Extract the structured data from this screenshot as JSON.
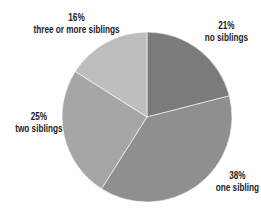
{
  "chart_data": {
    "type": "pie",
    "title": "",
    "categories": [
      "no siblings",
      "one sibling",
      "two siblings",
      "three or more siblings"
    ],
    "values": [
      21,
      38,
      25,
      16
    ],
    "labels": [
      "21%",
      "38%",
      "25%",
      "16%"
    ],
    "colors": [
      "#7b7b7b",
      "#8f8f8f",
      "#a6a6a6",
      "#bebebe"
    ],
    "start_angle_deg": -90,
    "direction": "clockwise",
    "legend": "none",
    "center": [
      147,
      117
    ],
    "radius": 85
  },
  "labels": {
    "no_siblings": {
      "pct": "21%",
      "text": "no siblings"
    },
    "one_sibling": {
      "pct": "38%",
      "text": "one sibling"
    },
    "two_siblings": {
      "pct": "25%",
      "text": "two siblings"
    },
    "three_plus": {
      "pct": "16%",
      "text": "three or more siblings"
    }
  }
}
